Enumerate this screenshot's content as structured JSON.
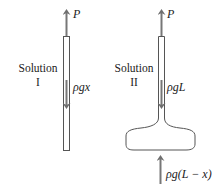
{
  "panels": [
    {
      "title_line1": "Solution",
      "title_line2": "I",
      "top_force": "P",
      "internal_force": "ρgx"
    },
    {
      "title_line1": "Solution",
      "title_line2": "II",
      "top_force": "P",
      "internal_force": "ρgL",
      "bottom_force": "ρg(L − x)"
    }
  ],
  "colors": {
    "arrow": "#777777",
    "outline": "#555555",
    "text": "#222222"
  }
}
